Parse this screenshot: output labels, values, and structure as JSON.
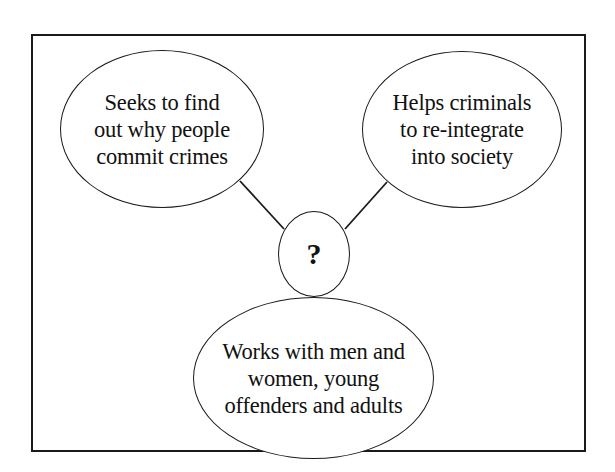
{
  "diagram": {
    "type": "concept-map",
    "center": {
      "label": "?"
    },
    "nodes": [
      {
        "id": "left",
        "lines": [
          "Seeks to find",
          "out why people",
          "commit crimes"
        ]
      },
      {
        "id": "right",
        "lines": [
          "Helps criminals",
          "to re-integrate",
          "into society"
        ]
      },
      {
        "id": "bottom",
        "lines": [
          "Works with men and",
          "women, young",
          "offenders and adults"
        ]
      }
    ],
    "edges": [
      {
        "from": "center",
        "to": "left"
      },
      {
        "from": "center",
        "to": "right"
      },
      {
        "from": "center",
        "to": "bottom"
      }
    ],
    "colors": {
      "stroke": "#1a1a1a",
      "background": "#ffffff",
      "text": "#111111"
    }
  }
}
